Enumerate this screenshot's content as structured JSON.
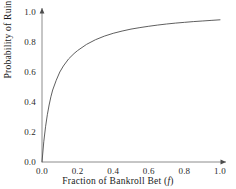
{
  "chart_data": {
    "type": "line",
    "title": "",
    "xlabel": "Fraction of Bankroll Bet (f)",
    "xlabel_text": "Fraction of Bankroll Bet (",
    "xlabel_var": "f",
    "xlabel_tail": ")",
    "ylabel": "Probability of Ruin",
    "xlim": [
      0.0,
      1.0
    ],
    "ylim": [
      0.0,
      1.0
    ],
    "grid": false,
    "legend": null,
    "line_color": "#4d4d4d",
    "axis_color": "#808080",
    "background": "#ffffff",
    "xticks": [
      "0.0",
      "0.2",
      "0.4",
      "0.6",
      "0.8",
      "1.0"
    ],
    "xtick_values": [
      0.0,
      0.2,
      0.4,
      0.6,
      0.8,
      1.0
    ],
    "yticks": [
      "0.0",
      "0.2",
      "0.4",
      "0.6",
      "0.8",
      "1.0"
    ],
    "ytick_values": [
      0.0,
      0.2,
      0.4,
      0.6,
      0.8,
      1.0
    ],
    "series": [
      {
        "name": "Probability of Ruin",
        "x": [
          0.0,
          0.01,
          0.02,
          0.03,
          0.04,
          0.05,
          0.06,
          0.08,
          0.1,
          0.12,
          0.15,
          0.18,
          0.2,
          0.25,
          0.3,
          0.35,
          0.4,
          0.45,
          0.5,
          0.55,
          0.6,
          0.65,
          0.7,
          0.75,
          0.8,
          0.85,
          0.9,
          0.95,
          1.0
        ],
        "y": [
          0.0,
          0.135,
          0.235,
          0.315,
          0.38,
          0.435,
          0.48,
          0.545,
          0.6,
          0.64,
          0.688,
          0.723,
          0.743,
          0.784,
          0.815,
          0.839,
          0.858,
          0.873,
          0.886,
          0.896,
          0.905,
          0.913,
          0.92,
          0.926,
          0.931,
          0.936,
          0.94,
          0.944,
          0.948
        ]
      }
    ]
  }
}
